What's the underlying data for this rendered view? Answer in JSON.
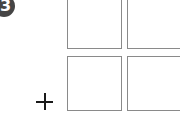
{
  "step_badge": {
    "label": "3",
    "color": "#454545",
    "text_color": "#ffffff"
  },
  "grid": {
    "rows": 2,
    "columns": 2,
    "border_color": "#8a8a8a",
    "cells": [
      {
        "row": 0,
        "col": 0
      },
      {
        "row": 0,
        "col": 1
      },
      {
        "row": 1,
        "col": 0
      },
      {
        "row": 1,
        "col": 1
      }
    ]
  },
  "add_control": {
    "symbol": "plus",
    "color": "#1a1a1a"
  }
}
